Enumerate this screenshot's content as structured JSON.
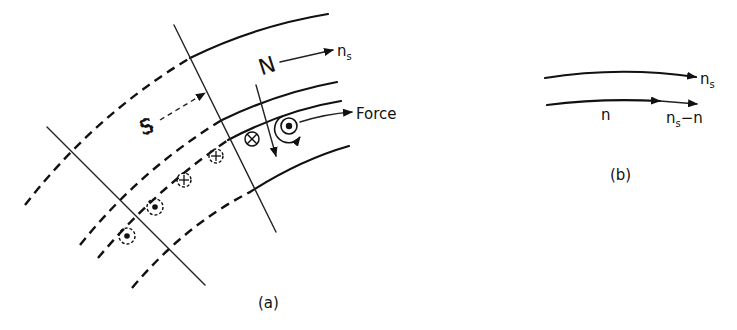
{
  "figure_a": {
    "caption": "(a)",
    "labels": {
      "north_pole": "N",
      "south_pole": "S",
      "synchronous_speed": "n",
      "synchronous_speed_sub": "s",
      "force": "Force"
    },
    "conductors": [
      {
        "type": "cross",
        "style": "solid"
      },
      {
        "type": "dot",
        "style": "solid",
        "ringed": true
      },
      {
        "type": "cross",
        "style": "dashed"
      },
      {
        "type": "cross",
        "style": "dashed"
      },
      {
        "type": "dot",
        "style": "dashed"
      },
      {
        "type": "dot",
        "style": "dashed"
      }
    ]
  },
  "figure_b": {
    "caption": "(b)",
    "labels": {
      "field_speed": "n",
      "field_speed_sub": "s",
      "rotor_speed": "n",
      "slip_speed": "n",
      "slip_speed_sub": "s",
      "slip_speed_suffix": "−n"
    }
  },
  "colors": {
    "ink": "#111111",
    "background": "#ffffff"
  }
}
